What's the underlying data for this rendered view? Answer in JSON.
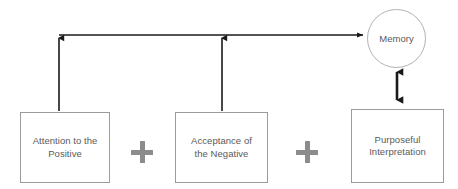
{
  "diagram": {
    "background_color": "#ffffff",
    "stroke_color": "#1a1a1a",
    "box_border_color": "#9b9b9b",
    "circle_border_color": "#b2b2b2",
    "text_color": "#5a5a5a",
    "plus_color": "#8c8c8c",
    "nodes": [
      {
        "id": "attention-positive",
        "label": "Attention to the\nPositive",
        "shape": "rectangle"
      },
      {
        "id": "acceptance-negative",
        "label": "Acceptance of\nthe Negative",
        "shape": "rectangle"
      },
      {
        "id": "purposeful-interpretation",
        "label": "Purposeful\nInterpretation",
        "shape": "rectangle"
      },
      {
        "id": "memory",
        "label": "Memory",
        "shape": "circle"
      }
    ],
    "operators": [
      {
        "id": "plus-one",
        "symbol": "+"
      },
      {
        "id": "plus-two",
        "symbol": "+"
      }
    ],
    "connectors": [
      {
        "id": "attention-to-memory",
        "from": "attention-positive",
        "to": "memory",
        "style": "elbow",
        "arrowheads": "both-ends"
      },
      {
        "id": "acceptance-to-memory",
        "from": "acceptance-negative",
        "to": "memory",
        "style": "elbow",
        "arrowheads": "both-ends"
      },
      {
        "id": "memory-interpretation",
        "from": "memory",
        "to": "purposeful-interpretation",
        "style": "straight",
        "arrowheads": "double"
      }
    ]
  }
}
